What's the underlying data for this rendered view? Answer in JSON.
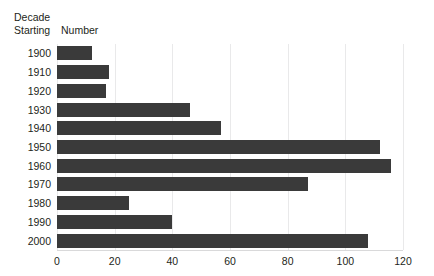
{
  "header": {
    "decade_label": "Decade\nStarting",
    "number_label": "Number"
  },
  "chart_data": {
    "type": "bar",
    "orientation": "horizontal",
    "title": "",
    "subtitle": "",
    "xlabel": "Number",
    "ylabel": "Decade Starting",
    "categories": [
      "1900",
      "1910",
      "1920",
      "1930",
      "1940",
      "1950",
      "1960",
      "1970",
      "1980",
      "1990",
      "2000"
    ],
    "values": [
      12,
      18,
      17,
      46,
      57,
      112,
      116,
      87,
      25,
      40,
      108
    ],
    "xlim": [
      0,
      120
    ],
    "xticks": [
      0,
      20,
      40,
      60,
      80,
      100,
      120
    ],
    "xticklabels": [
      "0",
      "20",
      "40",
      "60",
      "80",
      "100",
      "120"
    ],
    "grid": true,
    "grid_axis": "x",
    "legend": false,
    "bar_color": "#3a3a3a",
    "gridline_color": "#e9e9ea",
    "background_color": "#ffffff"
  }
}
